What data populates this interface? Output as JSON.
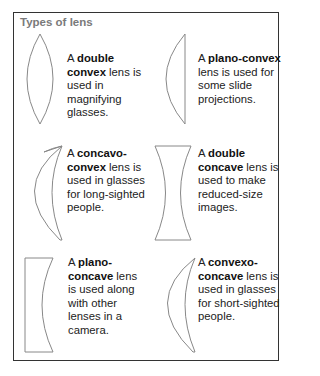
{
  "title": "Types of lens",
  "lenses": [
    {
      "name": "double convex",
      "pre": "A ",
      "bold": "double convex",
      "post": " lens is used in magnifying glasses.",
      "icon": "double-convex-lens-icon"
    },
    {
      "name": "plano-convex",
      "pre": "A ",
      "bold": "plano-convex",
      "post": " lens is used for some slide projections.",
      "icon": "plano-convex-lens-icon"
    },
    {
      "name": "concavo-convex",
      "pre": "A ",
      "bold": "concavo-convex",
      "post": " lens is used in glasses for long-sighted people.",
      "icon": "concavo-convex-lens-icon"
    },
    {
      "name": "double concave",
      "pre": "A ",
      "bold": "double concave",
      "post": " lens is used to make reduced-size images.",
      "icon": "double-concave-lens-icon"
    },
    {
      "name": "plano-concave",
      "pre": "A ",
      "bold": "plano-concave",
      "post": " lens is used along with other lenses in a camera.",
      "icon": "plano-concave-lens-icon"
    },
    {
      "name": "convexo-concave",
      "pre": "A ",
      "bold": "convexo-concave",
      "post": " lens is used in glasses for short-sighted people.",
      "icon": "convexo-concave-lens-icon"
    }
  ],
  "colors": {
    "border": "#333333",
    "title": "#7a7a7a",
    "lens_stroke": "#888888"
  }
}
